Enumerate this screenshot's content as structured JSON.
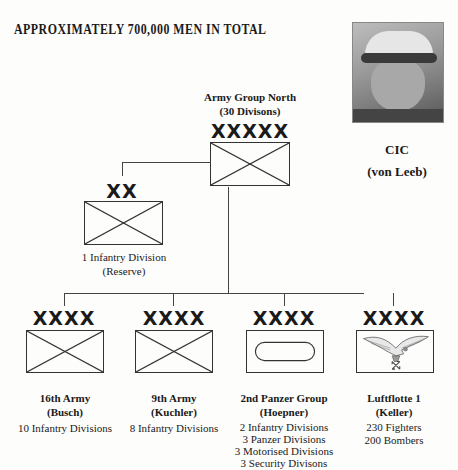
{
  "headline": "APPROXIMATELY 700,000 MEN IN TOTAL",
  "commander": {
    "title": "CIC",
    "name": "(von Leeb)",
    "photo": "portrait-photo"
  },
  "hq": {
    "name": "Army Group North",
    "detail": "(30 Divisons)",
    "echelon": "XXXXX",
    "symbol": "infantry-cross"
  },
  "reserve": {
    "echelon": "XX",
    "symbol": "infantry-cross",
    "lines": [
      "1 Infantry Division",
      "(Reserve)"
    ]
  },
  "armies": [
    {
      "echelon": "XXXX",
      "symbol": "infantry-cross",
      "name": "16th Army",
      "commander": "(Busch)",
      "units": [
        "10 Infantry Divisions"
      ]
    },
    {
      "echelon": "XXXX",
      "symbol": "infantry-cross",
      "name": "9th Army",
      "commander": "(Kuchler)",
      "units": [
        "8 Infantry Divisions"
      ]
    },
    {
      "echelon": "XXXX",
      "symbol": "armor-oval",
      "name": "2nd Panzer Group",
      "commander": "(Hoepner)",
      "units": [
        "2 Infantry Divisions",
        "3 Panzer Divisions",
        "3 Motorised Divisions",
        "3 Security Divisons"
      ]
    },
    {
      "echelon": "XXXX",
      "symbol": "luftwaffe-eagle",
      "name": "Luftflotte 1",
      "commander": "(Keller)",
      "units": [
        "230 Fighters",
        "200 Bombers"
      ]
    }
  ]
}
